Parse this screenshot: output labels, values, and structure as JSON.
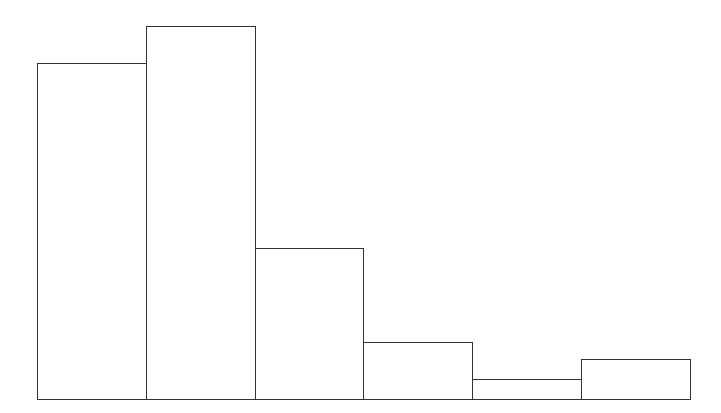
{
  "chart_data": {
    "type": "bar",
    "title": "",
    "xlabel": "",
    "ylabel": "",
    "categories": [
      "1",
      "2",
      "3",
      "4",
      "5",
      "6"
    ],
    "values": [
      336,
      373,
      151,
      57,
      20,
      40
    ],
    "value_units": "relative (pixel heights; no axis shown)",
    "grid": false,
    "legend": null,
    "style": {
      "fill": "#ffffff",
      "stroke": "#333333"
    },
    "layout": {
      "x_start": 37,
      "bar_width": 108.8,
      "baseline_y": 399
    }
  }
}
